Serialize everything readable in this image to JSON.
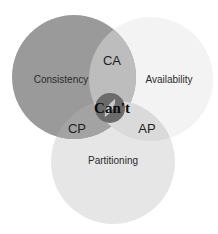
{
  "diagram": {
    "type": "venn",
    "background": "#ffffff",
    "circles": [
      {
        "id": "consistency",
        "label": "Consistency",
        "cx": 74,
        "cy": 77,
        "r": 62,
        "color": "#9a9a9a",
        "label_x": 61,
        "label_y": 83
      },
      {
        "id": "availability",
        "label": "Availability",
        "cx": 151,
        "cy": 79,
        "r": 62,
        "color": "#f3f3f3",
        "label_x": 169,
        "label_y": 83
      },
      {
        "id": "partitioning",
        "label": "Partitioning",
        "cx": 113,
        "cy": 162,
        "r": 62,
        "color": "#e6e6e6",
        "label_x": 113,
        "label_y": 164
      }
    ],
    "intersections": [
      {
        "id": "ca",
        "label": "CA",
        "color": "#bdbdbd",
        "label_x": 112,
        "label_y": 65
      },
      {
        "id": "cp",
        "label": "CP",
        "color": "#a3a3a3",
        "label_x": 77,
        "label_y": 133
      },
      {
        "id": "ap",
        "label": "AP",
        "color": "#dadada",
        "label_x": 147,
        "label_y": 133
      }
    ],
    "center": {
      "label": "Can't",
      "icon": "prohibition-icon",
      "cx": 110,
      "cy": 108,
      "r": 15,
      "color": "#6b6b6b",
      "slash_color": "#c8c8c8",
      "text_color": "#0c0c0c"
    }
  }
}
